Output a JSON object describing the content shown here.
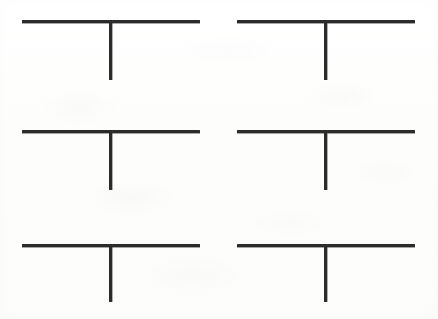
{
  "page": {
    "width": 438,
    "height": 319,
    "background_color": "#fdfdfd",
    "ink_color": "#2b2b2b",
    "figure_count": 6,
    "layout": "3 rows x 2 columns",
    "figure_shape": "inverted-T",
    "text_content": ""
  },
  "figures": [
    {
      "id": "figure-1",
      "position": "top-left",
      "row": 1,
      "column": 1,
      "horizontal_bar": {
        "x": 22,
        "y": 20,
        "length": 178,
        "thickness": 3
      },
      "vertical_stem": {
        "x": 109,
        "y": 20,
        "length": 60,
        "thickness": 3
      },
      "label": ""
    },
    {
      "id": "figure-2",
      "position": "top-right",
      "row": 1,
      "column": 2,
      "horizontal_bar": {
        "x": 237,
        "y": 20,
        "length": 178,
        "thickness": 3
      },
      "vertical_stem": {
        "x": 324,
        "y": 20,
        "length": 60,
        "thickness": 3
      },
      "label": ""
    },
    {
      "id": "figure-3",
      "position": "middle-left",
      "row": 2,
      "column": 1,
      "horizontal_bar": {
        "x": 22,
        "y": 130,
        "length": 178,
        "thickness": 3
      },
      "vertical_stem": {
        "x": 109,
        "y": 130,
        "length": 60,
        "thickness": 3
      },
      "label": ""
    },
    {
      "id": "figure-4",
      "position": "middle-right",
      "row": 2,
      "column": 2,
      "horizontal_bar": {
        "x": 237,
        "y": 130,
        "length": 178,
        "thickness": 3
      },
      "vertical_stem": {
        "x": 324,
        "y": 130,
        "length": 60,
        "thickness": 3
      },
      "label": ""
    },
    {
      "id": "figure-5",
      "position": "bottom-left",
      "row": 3,
      "column": 1,
      "horizontal_bar": {
        "x": 22,
        "y": 244,
        "length": 178,
        "thickness": 3
      },
      "vertical_stem": {
        "x": 109,
        "y": 244,
        "length": 58,
        "thickness": 3
      },
      "label": ""
    },
    {
      "id": "figure-6",
      "position": "bottom-right",
      "row": 3,
      "column": 2,
      "horizontal_bar": {
        "x": 237,
        "y": 244,
        "length": 178,
        "thickness": 3
      },
      "vertical_stem": {
        "x": 324,
        "y": 244,
        "length": 58,
        "thickness": 3
      },
      "label": ""
    }
  ]
}
